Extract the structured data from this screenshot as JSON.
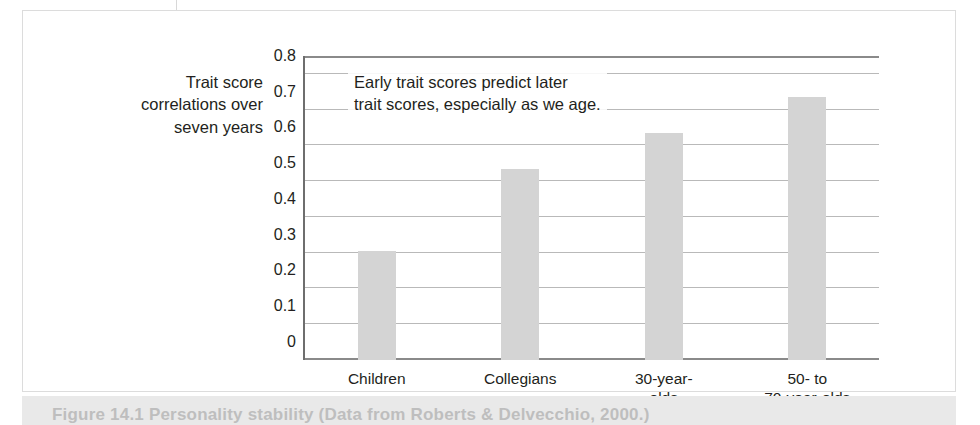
{
  "figure": {
    "caption": "Figure 14.1  Personality stability (Data from Roberts & Delvecchio, 2000.)",
    "top_tick": "page-fold-tick"
  },
  "chart_data": {
    "type": "bar",
    "title": "",
    "axis_title_lines": [
      "Trait score",
      "correlations over",
      "seven years"
    ],
    "annotation_lines": [
      "Early trait scores predict later",
      "trait scores, especially as we age."
    ],
    "categories": [
      "Children",
      "Collegians",
      "30-year-olds",
      "50- to 70-year-olds"
    ],
    "category_label_lines": [
      [
        "Children"
      ],
      [
        "Collegians"
      ],
      [
        "30-year-",
        "olds"
      ],
      [
        "50-  to",
        "70-year-olds"
      ]
    ],
    "values": [
      0.305,
      0.535,
      0.635,
      0.735
    ],
    "xlabel": "",
    "ylabel": "Trait score correlations over seven years",
    "ylim": [
      0,
      0.85
    ],
    "yticks": [
      0,
      0.1,
      0.2,
      0.3,
      0.4,
      0.5,
      0.6,
      0.7,
      0.8
    ],
    "ytick_labels": [
      "0",
      "0.1",
      "0.2",
      "0.3",
      "0.4",
      "0.5",
      "0.6",
      "0.7",
      "0.8"
    ],
    "grid": true,
    "legend": "none",
    "bar_color": "#d4d4d4",
    "axis_color": "#6e6e6e",
    "grid_color": "#b9b9b9",
    "text_color": "#231f20"
  }
}
